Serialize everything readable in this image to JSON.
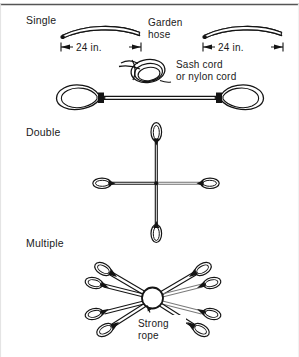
{
  "figure": {
    "background_color": "#ffffff",
    "ink_color": "#141414",
    "top_rule": true,
    "sections": [
      {
        "id": "single",
        "label": "Single"
      },
      {
        "id": "double",
        "label": "Double"
      },
      {
        "id": "multiple",
        "label": "Multiple"
      }
    ],
    "callouts": [
      {
        "id": "garden-hose",
        "lines": [
          "Garden",
          "hose"
        ]
      },
      {
        "id": "sash-cord",
        "lines": [
          "Sash cord",
          "or nylon cord"
        ]
      },
      {
        "id": "strong-rope",
        "lines": [
          "Strong",
          "rope"
        ]
      }
    ],
    "dimensions": [
      {
        "id": "hose-left-length",
        "value": "24",
        "unit": "in.",
        "text": "24  in."
      },
      {
        "id": "hose-right-length",
        "value": "24",
        "unit": "in.",
        "text": "24  in."
      }
    ],
    "single": {
      "hose_pieces": 2,
      "sling_loops": 2,
      "coil": {
        "turns": 3
      }
    },
    "double": {
      "arms": 4,
      "loops_per_arm": 1,
      "arm_directions": [
        "up",
        "right",
        "down",
        "left"
      ]
    },
    "multiple": {
      "arms": 8,
      "center": {
        "shape": "circle",
        "meaning": "rope cross-section"
      }
    }
  }
}
